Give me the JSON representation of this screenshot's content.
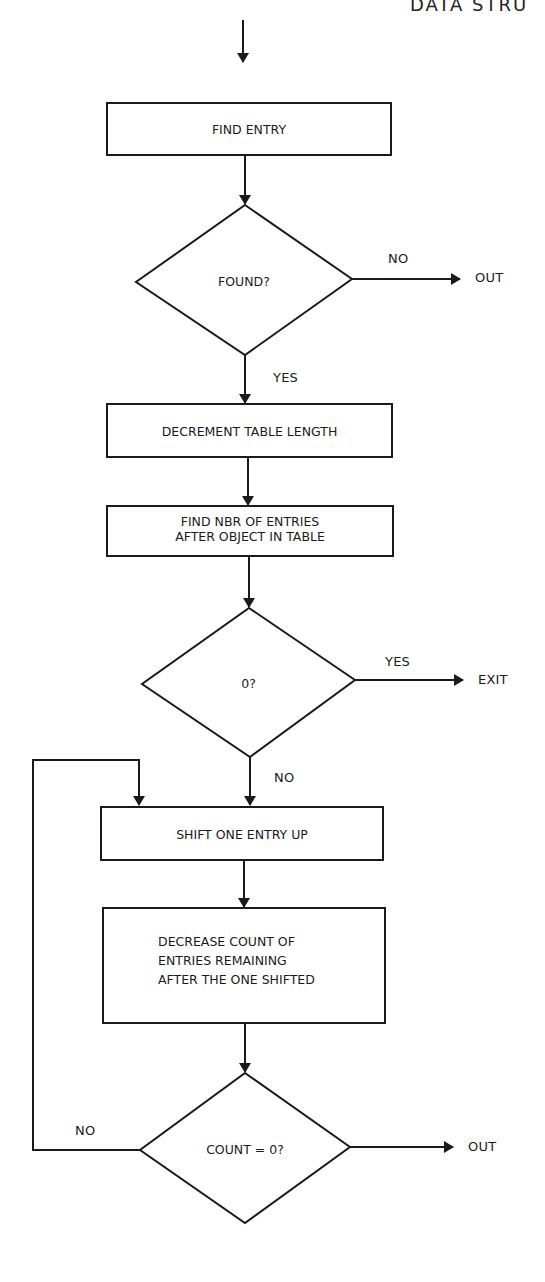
{
  "header": {
    "text": "DATA STRU"
  },
  "flowchart": {
    "nodes": [
      {
        "id": "find-entry",
        "type": "process",
        "label": "FIND ENTRY"
      },
      {
        "id": "found",
        "type": "decision",
        "label": "FOUND?"
      },
      {
        "id": "decrement",
        "type": "process",
        "label": "DECREMENT TABLE LENGTH"
      },
      {
        "id": "find-nbr",
        "type": "process",
        "label": "FIND NBR OF ENTRIES\nAFTER OBJECT IN TABLE"
      },
      {
        "id": "zero",
        "type": "decision",
        "label": "0?"
      },
      {
        "id": "shift",
        "type": "process",
        "label": "SHIFT ONE ENTRY UP"
      },
      {
        "id": "decrease",
        "type": "process",
        "label": "DECREASE COUNT OF\nENTRIES REMAINING\nAFTER THE ONE SHIFTED"
      },
      {
        "id": "count-zero",
        "type": "decision",
        "label": "COUNT = 0?"
      }
    ],
    "terminals": {
      "out1": "OUT",
      "exit": "EXIT",
      "out2": "OUT"
    },
    "edge_labels": {
      "found_no": "NO",
      "found_yes": "YES",
      "zero_yes": "YES",
      "zero_no": "NO",
      "count_no": "NO"
    },
    "edges": [
      {
        "from": "start",
        "to": "find-entry"
      },
      {
        "from": "find-entry",
        "to": "found"
      },
      {
        "from": "found",
        "to": "out1",
        "label": "NO"
      },
      {
        "from": "found",
        "to": "decrement",
        "label": "YES"
      },
      {
        "from": "decrement",
        "to": "find-nbr"
      },
      {
        "from": "find-nbr",
        "to": "zero"
      },
      {
        "from": "zero",
        "to": "exit",
        "label": "YES"
      },
      {
        "from": "zero",
        "to": "shift",
        "label": "NO"
      },
      {
        "from": "shift",
        "to": "decrease"
      },
      {
        "from": "decrease",
        "to": "count-zero"
      },
      {
        "from": "count-zero",
        "to": "shift",
        "label": "NO"
      },
      {
        "from": "count-zero",
        "to": "out2"
      }
    ]
  },
  "colors": {
    "stroke": "#1a1a1a",
    "background": "#ffffff"
  }
}
